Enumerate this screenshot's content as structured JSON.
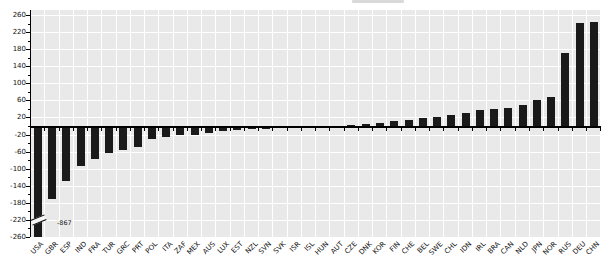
{
  "chart_data": {
    "type": "bar",
    "title": "",
    "xlabel": "",
    "ylabel": "",
    "categories": [
      "USA",
      "GBR",
      "ESP",
      "IND",
      "FRA",
      "TUR",
      "GRC",
      "PRT",
      "POL",
      "ITA",
      "ZAF",
      "MEX",
      "AUS",
      "LUX",
      "EST",
      "NZL",
      "SVN",
      "SVK",
      "ISR",
      "ISL",
      "HUN",
      "AUT",
      "CZE",
      "DNK",
      "KOR",
      "FIN",
      "CHE",
      "BEL",
      "SWE",
      "CHL",
      "IDN",
      "IRL",
      "BRA",
      "CAN",
      "NLD",
      "JPN",
      "NOR",
      "RUS",
      "DEU",
      "CHN"
    ],
    "values": [
      -867,
      -170,
      -128,
      -92,
      -76,
      -62,
      -56,
      -49,
      -30,
      -25,
      -21,
      -19,
      -16,
      -11,
      -9,
      -7,
      -6,
      -4,
      -3,
      -2,
      -1,
      2,
      4,
      6,
      9,
      12,
      16,
      19,
      22,
      26,
      32,
      38,
      41,
      44,
      50,
      61,
      69,
      172,
      242,
      245
    ],
    "ylim": [
      -260,
      260
    ],
    "yticks": [
      260,
      220,
      180,
      140,
      100,
      60,
      20,
      -20,
      -60,
      -100,
      -140,
      -180,
      -220,
      -260
    ],
    "grid": "on",
    "legend": "none",
    "clipped_bars": [
      "USA"
    ],
    "annotations": [
      {
        "text": "-867",
        "category": "USA"
      }
    ],
    "colors": {
      "bar": "#1a1a1a",
      "plot_background": "#e9e9e9",
      "gridline": "#ffffff",
      "axis": "#000000",
      "label_text": "#111111"
    }
  }
}
